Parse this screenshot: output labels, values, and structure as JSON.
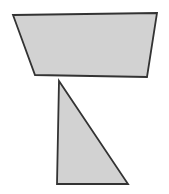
{
  "canvas": {
    "width": 169,
    "height": 194,
    "background_color": "#ffffff",
    "title": "Geometric Shapes"
  },
  "style": {
    "fill_color": "#d2d2d2",
    "stroke_color": "#333333",
    "stroke_width": 1.8,
    "stroke_linejoin": "miter"
  },
  "shapes": [
    {
      "name": "trapezoid",
      "label": "Trapezoid",
      "sides": 4,
      "fill_color": "#d2d2d2",
      "stroke_color": "#333333",
      "points": "13,15 157,13 147,77 35,75",
      "vertices": [
        {
          "x": 13,
          "y": 15
        },
        {
          "x": 157,
          "y": 13
        },
        {
          "x": 147,
          "y": 77
        },
        {
          "x": 35,
          "y": 75
        }
      ]
    },
    {
      "name": "right-triangle",
      "label": "Right Triangle",
      "sides": 3,
      "fill_color": "#d2d2d2",
      "stroke_color": "#333333",
      "points": "59,81 128,184 57,184",
      "vertices": [
        {
          "x": 59,
          "y": 81
        },
        {
          "x": 128,
          "y": 184
        },
        {
          "x": 57,
          "y": 184
        }
      ]
    }
  ]
}
